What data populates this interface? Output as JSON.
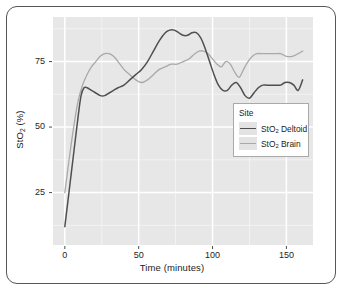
{
  "chart_data": {
    "type": "line",
    "title": "",
    "xlabel": "Time (minutes)",
    "ylabel": "StO2 (%)",
    "ylabel_parts": {
      "pre": "StO",
      "sub": "2",
      "post": " (%)"
    },
    "xlim": [
      -8,
      168
    ],
    "ylim": [
      5,
      92
    ],
    "xticks": [
      0,
      50,
      100,
      150
    ],
    "xtick_labels": [
      "0",
      "50",
      "100",
      "150"
    ],
    "yticks": [
      25,
      50,
      75
    ],
    "ytick_labels": [
      "25",
      "50",
      "75"
    ],
    "grid": true,
    "grid_color": "#ffffff",
    "panel_background": "#e7e7e7",
    "legend": {
      "title": "Site",
      "position": "inside-right-middle",
      "entries": [
        {
          "label": "StO2 Deltoid",
          "pre": "StO",
          "sub": "2",
          "post": " Deltoid",
          "color": "#4f4f4f"
        },
        {
          "label": "StO2 Brain",
          "pre": "StO",
          "sub": "2",
          "post": " Brain",
          "color": "#a9a9a9"
        }
      ]
    },
    "series": [
      {
        "name": "StO2 Deltoid",
        "color": "#4f4f4f",
        "x": [
          0,
          3,
          6,
          9,
          11,
          13,
          15,
          18,
          21,
          24,
          27,
          30,
          33,
          36,
          40,
          44,
          48,
          52,
          56,
          60,
          64,
          68,
          71,
          74,
          77,
          80,
          83,
          86,
          89,
          92,
          95,
          98,
          101,
          104,
          107,
          110,
          113,
          116,
          119,
          122,
          125,
          128,
          131,
          134,
          137,
          140,
          143,
          146,
          149,
          152,
          155,
          158,
          161
        ],
        "y": [
          12,
          26,
          40,
          54,
          62,
          65,
          65,
          64,
          63,
          62,
          62,
          63,
          64,
          65,
          66,
          68,
          70,
          72,
          75,
          79,
          83,
          86,
          87,
          87,
          86,
          85,
          85,
          86,
          86,
          84,
          80,
          75,
          70,
          66,
          64,
          64,
          66,
          67,
          65,
          62,
          61,
          63,
          65,
          66,
          66,
          66,
          66,
          66,
          67,
          67,
          66,
          64,
          68
        ]
      },
      {
        "name": "StO2 Brain",
        "color": "#a9a9a9",
        "x": [
          0,
          3,
          6,
          9,
          12,
          15,
          18,
          21,
          24,
          27,
          30,
          33,
          36,
          40,
          44,
          48,
          52,
          56,
          60,
          64,
          68,
          72,
          76,
          80,
          84,
          88,
          91,
          94,
          97,
          100,
          103,
          106,
          109,
          112,
          115,
          118,
          121,
          124,
          127,
          130,
          134,
          138,
          142,
          146,
          150,
          154,
          158,
          161
        ],
        "y": [
          25,
          38,
          50,
          60,
          66,
          70,
          73,
          75,
          77,
          78,
          78,
          77,
          75,
          72,
          70,
          68,
          67,
          68,
          70,
          72,
          73,
          74,
          74,
          75,
          76,
          78,
          79,
          79,
          78,
          76,
          74,
          73,
          75,
          74,
          71,
          69,
          72,
          75,
          77,
          78,
          78,
          78,
          78,
          78,
          77,
          77,
          78,
          79
        ]
      }
    ]
  }
}
